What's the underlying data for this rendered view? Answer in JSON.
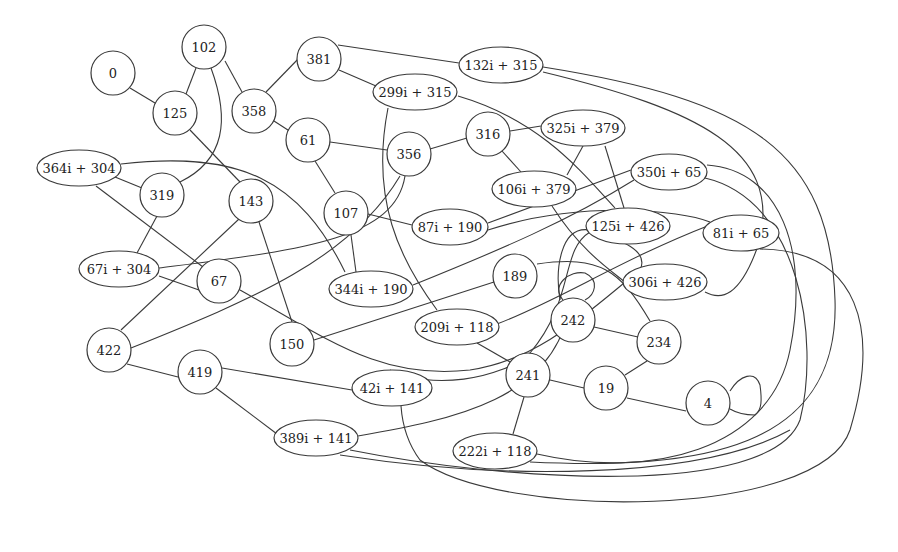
{
  "diagram": {
    "type": "undirected-graph",
    "nodes": [
      {
        "id": "n0",
        "label": "0",
        "shape": "circle",
        "x": 113,
        "y": 73,
        "r": 22
      },
      {
        "id": "n102",
        "label": "102",
        "shape": "circle",
        "x": 204,
        "y": 47,
        "r": 22
      },
      {
        "id": "n125",
        "label": "125",
        "shape": "circle",
        "x": 175,
        "y": 113,
        "r": 22
      },
      {
        "id": "n358",
        "label": "358",
        "shape": "circle",
        "x": 254,
        "y": 111,
        "r": 22
      },
      {
        "id": "n381",
        "label": "381",
        "shape": "circle",
        "x": 319,
        "y": 59,
        "r": 22
      },
      {
        "id": "n132i",
        "label": "132i + 315",
        "shape": "ellipse",
        "x": 501,
        "y": 65,
        "rx": 42,
        "ry": 18
      },
      {
        "id": "n299i",
        "label": "299i + 315",
        "shape": "ellipse",
        "x": 415,
        "y": 92,
        "rx": 42,
        "ry": 18
      },
      {
        "id": "n61",
        "label": "61",
        "shape": "circle",
        "x": 308,
        "y": 140,
        "r": 22
      },
      {
        "id": "n356",
        "label": "356",
        "shape": "circle",
        "x": 409,
        "y": 154,
        "r": 22
      },
      {
        "id": "n316",
        "label": "316",
        "shape": "circle",
        "x": 488,
        "y": 134,
        "r": 22
      },
      {
        "id": "n325i",
        "label": "325i + 379",
        "shape": "ellipse",
        "x": 583,
        "y": 128,
        "rx": 42,
        "ry": 18
      },
      {
        "id": "n106i",
        "label": "106i + 379",
        "shape": "ellipse",
        "x": 534,
        "y": 189,
        "rx": 42,
        "ry": 18
      },
      {
        "id": "n364i",
        "label": "364i + 304",
        "shape": "ellipse",
        "x": 79,
        "y": 168,
        "rx": 42,
        "ry": 18
      },
      {
        "id": "n319",
        "label": "319",
        "shape": "circle",
        "x": 162,
        "y": 195,
        "r": 22
      },
      {
        "id": "n143",
        "label": "143",
        "shape": "circle",
        "x": 251,
        "y": 201,
        "r": 22
      },
      {
        "id": "n107",
        "label": "107",
        "shape": "circle",
        "x": 346,
        "y": 213,
        "r": 22
      },
      {
        "id": "n87i",
        "label": "87i + 190",
        "shape": "ellipse",
        "x": 450,
        "y": 227,
        "rx": 38,
        "ry": 18
      },
      {
        "id": "n350i",
        "label": "350i + 65",
        "shape": "ellipse",
        "x": 669,
        "y": 172,
        "rx": 38,
        "ry": 18
      },
      {
        "id": "n125i",
        "label": "125i + 426",
        "shape": "ellipse",
        "x": 628,
        "y": 226,
        "rx": 42,
        "ry": 18
      },
      {
        "id": "n81i",
        "label": "81i + 65",
        "shape": "ellipse",
        "x": 741,
        "y": 233,
        "rx": 38,
        "ry": 18
      },
      {
        "id": "n67i",
        "label": "67i + 304",
        "shape": "ellipse",
        "x": 119,
        "y": 269,
        "rx": 40,
        "ry": 18
      },
      {
        "id": "n67",
        "label": "67",
        "shape": "circle",
        "x": 219,
        "y": 281,
        "r": 22
      },
      {
        "id": "n344i",
        "label": "344i + 190",
        "shape": "ellipse",
        "x": 371,
        "y": 289,
        "rx": 42,
        "ry": 18
      },
      {
        "id": "n189",
        "label": "189",
        "shape": "circle",
        "x": 515,
        "y": 276,
        "r": 22
      },
      {
        "id": "n306i",
        "label": "306i + 426",
        "shape": "ellipse",
        "x": 665,
        "y": 282,
        "rx": 42,
        "ry": 18
      },
      {
        "id": "n209i",
        "label": "209i + 118",
        "shape": "ellipse",
        "x": 457,
        "y": 327,
        "rx": 42,
        "ry": 18
      },
      {
        "id": "n242",
        "label": "242",
        "shape": "circle",
        "x": 573,
        "y": 320,
        "r": 22
      },
      {
        "id": "n234",
        "label": "234",
        "shape": "circle",
        "x": 659,
        "y": 342,
        "r": 22
      },
      {
        "id": "n422",
        "label": "422",
        "shape": "circle",
        "x": 109,
        "y": 350,
        "r": 22
      },
      {
        "id": "n150",
        "label": "150",
        "shape": "circle",
        "x": 292,
        "y": 344,
        "r": 22
      },
      {
        "id": "n419",
        "label": "419",
        "shape": "circle",
        "x": 200,
        "y": 372,
        "r": 22
      },
      {
        "id": "n42i",
        "label": "42i + 141",
        "shape": "ellipse",
        "x": 392,
        "y": 388,
        "rx": 40,
        "ry": 18
      },
      {
        "id": "n241",
        "label": "241",
        "shape": "circle",
        "x": 528,
        "y": 375,
        "r": 22
      },
      {
        "id": "n19",
        "label": "19",
        "shape": "circle",
        "x": 606,
        "y": 388,
        "r": 22
      },
      {
        "id": "n4",
        "label": "4",
        "shape": "circle",
        "x": 708,
        "y": 403,
        "r": 22
      },
      {
        "id": "n389i",
        "label": "389i + 141",
        "shape": "ellipse",
        "x": 316,
        "y": 438,
        "rx": 42,
        "ry": 18
      },
      {
        "id": "n222i",
        "label": "222i + 118",
        "shape": "ellipse",
        "x": 495,
        "y": 451,
        "rx": 42,
        "ry": 18
      }
    ],
    "edges": [
      {
        "from": "n0",
        "to": "n125",
        "path": "M130,88 L160,106"
      },
      {
        "from": "n102",
        "to": "n125",
        "path": "M196,68 L186,94"
      },
      {
        "from": "n102",
        "to": "n358",
        "path": "M225,61 L242,92"
      },
      {
        "from": "n102",
        "to": "n319",
        "path": "M211,68 C230,120 225,160 180,182"
      },
      {
        "from": "n125",
        "to": "n143",
        "path": "M190,130 L240,182"
      },
      {
        "from": "n358",
        "to": "n381",
        "path": "M266,92 L301,56"
      },
      {
        "from": "n358",
        "to": "n61",
        "path": "M274,121 L291,132"
      },
      {
        "from": "n381",
        "to": "n132i",
        "path": "M338,45 L459,63"
      },
      {
        "from": "n381",
        "to": "n299i",
        "path": "M339,70 L376,86"
      },
      {
        "from": "n299i",
        "to": "n209i",
        "path": "M388,108 C370,200 400,260 437,310"
      },
      {
        "from": "n299i",
        "to": "n125i",
        "path": "M458,96 C540,120 580,170 615,208"
      },
      {
        "from": "n61",
        "to": "n356",
        "path": "M330,142 L387,150"
      },
      {
        "from": "n61",
        "to": "n107",
        "path": "M315,161 L335,193"
      },
      {
        "from": "n356",
        "to": "n316",
        "path": "M430,149 L467,138"
      },
      {
        "from": "n356",
        "to": "n67i",
        "path": "M405,176 C395,240 300,250 159,268"
      },
      {
        "from": "n316",
        "to": "n325i",
        "path": "M510,131 L541,126"
      },
      {
        "from": "n316",
        "to": "n106i",
        "path": "M502,151 L521,172"
      },
      {
        "from": "n325i",
        "to": "n106i",
        "path": "M583,146 L567,175"
      },
      {
        "from": "n325i",
        "to": "n125i",
        "path": "M605,146 L624,208"
      },
      {
        "from": "n364i",
        "to": "n319",
        "path": "M115,177 L142,188"
      },
      {
        "from": "n364i",
        "to": "n67",
        "path": "M96,186 L203,267"
      },
      {
        "from": "n364i",
        "to": "n344i",
        "path": "M121,164 C240,150 300,180 345,272"
      },
      {
        "from": "n319",
        "to": "n67i",
        "path": "M157,216 L137,253"
      },
      {
        "from": "n143",
        "to": "n422",
        "path": "M239,219 L121,330"
      },
      {
        "from": "n143",
        "to": "n150",
        "path": "M259,222 L292,322"
      },
      {
        "from": "n107",
        "to": "n87i",
        "path": "M368,214 L412,225"
      },
      {
        "from": "n107",
        "to": "n344i",
        "path": "M351,235 L356,272"
      },
      {
        "from": "n87i",
        "to": "n350i",
        "path": "M488,223 L631,170"
      },
      {
        "from": "n67i",
        "to": "n67",
        "path": "M159,276 L199,290"
      },
      {
        "from": "n67",
        "to": "n234",
        "path": "M240,290 C330,340 380,380 470,370 C540,360 590,310 640,270 C650,250 620,240 590,230 C560,225 555,270 560,300"
      },
      {
        "from": "n344i",
        "to": "n350i",
        "path": "M413,285 C500,250 570,220 634,180"
      },
      {
        "from": "n422",
        "to": "n356",
        "path": "M131,348 C250,300 350,260 400,176"
      },
      {
        "from": "n422",
        "to": "n419",
        "path": "M127,364 L178,377"
      },
      {
        "from": "n150",
        "to": "n189",
        "path": "M314,340 L494,282"
      },
      {
        "from": "n189",
        "to": "n234",
        "path": "M537,264 C600,255 620,270 650,321"
      },
      {
        "from": "n106i",
        "to": "n306i",
        "path": "M552,206 C580,250 610,270 625,282"
      },
      {
        "from": "n125i",
        "to": "n241",
        "path": "M590,232 C560,250 575,300 530,353 C500,380 430,390 390,370"
      },
      {
        "from": "n350i",
        "to": "n222i",
        "path": "M707,165 C780,170 810,250 790,350 C770,450 650,480 537,454"
      },
      {
        "from": "n350i",
        "to": "n389i",
        "path": "M705,178 C800,200 820,340 800,420 C770,500 500,480 350,450"
      },
      {
        "from": "n81i",
        "to": "n209i",
        "path": "M710,225 C620,260 560,300 497,324"
      },
      {
        "from": "n81i",
        "to": "n42i",
        "path": "M760,249 C860,250 880,330 850,430 C820,520 500,520 420,460 C405,440 402,420 401,406"
      },
      {
        "from": "n87i",
        "to": "n81i",
        "path": "M488,230 C580,200 680,210 710,222"
      },
      {
        "from": "n132i",
        "to": "n222i",
        "path": "M543,67 C750,100 830,150 835,300 C840,450 700,470 530,462"
      },
      {
        "from": "n132i",
        "to": "n306i",
        "path": "M543,72 C700,110 780,150 760,240 C740,300 720,300 705,292"
      },
      {
        "from": "n209i",
        "to": "n241",
        "path": "M477,343 L510,362"
      },
      {
        "from": "n242",
        "to": "n242",
        "path": "M563,300 C550,285 570,270 585,273 C600,280 595,295 585,300"
      },
      {
        "from": "n242",
        "to": "n234",
        "path": "M594,327 L638,337"
      },
      {
        "from": "n234",
        "to": "n19",
        "path": "M647,361 L625,375"
      },
      {
        "from": "n241",
        "to": "n19",
        "path": "M550,380 L584,388"
      },
      {
        "from": "n241",
        "to": "n222i",
        "path": "M524,397 L513,434"
      },
      {
        "from": "n19",
        "to": "n4",
        "path": "M627,398 L686,411"
      },
      {
        "from": "n4",
        "to": "n4",
        "path": "M730,391 C740,375 755,370 760,385 C762,400 762,410 755,415 C745,415 735,412 730,409"
      },
      {
        "from": "n419",
        "to": "n42i",
        "path": "M222,368 L352,390"
      },
      {
        "from": "n419",
        "to": "n389i",
        "path": "M216,388 L277,434"
      },
      {
        "from": "n42i",
        "to": "n389i",
        "path": "M570,300 C560,400 450,420 358,436"
      },
      {
        "from": "n389i",
        "to": "n350i_b",
        "path": "M340,455 C500,480 700,480 790,430"
      }
    ]
  }
}
